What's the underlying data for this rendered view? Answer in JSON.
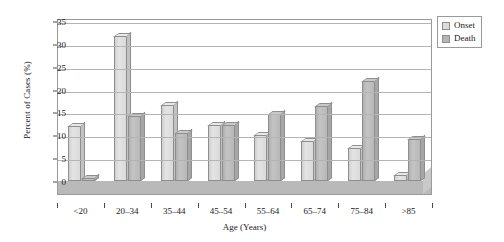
{
  "chart_data": {
    "type": "bar",
    "title": "",
    "xlabel": "Age (Years)",
    "ylabel": "Percent of Cases (%)",
    "categories": [
      "<20",
      "20–34",
      "35–44",
      "45–54",
      "55–64",
      "65–74",
      "75–84",
      ">85"
    ],
    "series": [
      {
        "name": "Onset",
        "color": "#dcdcdc",
        "values": [
          12.1,
          31.8,
          16.6,
          12.3,
          10.0,
          8.8,
          7.3,
          1.3
        ]
      },
      {
        "name": "Death",
        "color": "#b5b5b5",
        "values": [
          0.6,
          14.2,
          10.5,
          12.2,
          14.7,
          16.5,
          21.8,
          9.2
        ]
      }
    ],
    "ylim": [
      0,
      35
    ],
    "yticks": [
      0,
      5,
      10,
      15,
      20,
      25,
      30,
      35
    ],
    "grid": true,
    "legend_position": "top-right"
  },
  "legend": {
    "items": [
      {
        "label": "Onset"
      },
      {
        "label": "Death"
      }
    ]
  }
}
